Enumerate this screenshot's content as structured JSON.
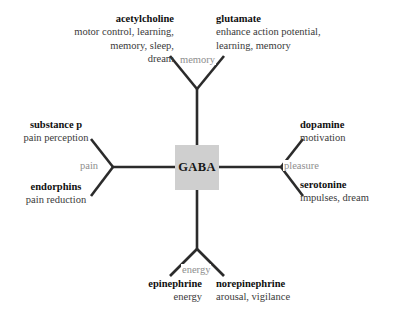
{
  "diagram": {
    "type": "radial-mind-map",
    "center": {
      "label": "GABA",
      "box_color": "#cfcfcf"
    },
    "colors": {
      "line": "#2b2b2b",
      "edge_label": "#8e8e8e",
      "title": "#101010",
      "description": "#3a3a3a",
      "background": "#ffffff"
    },
    "branches": [
      {
        "edge_label": "memory",
        "direction": "up",
        "leaves": [
          {
            "title": "acetylcholine",
            "description": "motor control, learning, memory, sleep, dream"
          },
          {
            "title": "glutamate",
            "description": "enhance action potential, learning, memory"
          }
        ]
      },
      {
        "edge_label": "pain",
        "direction": "left",
        "leaves": [
          {
            "title": "substance p",
            "description": "pain perception"
          },
          {
            "title": "endorphins",
            "description": "pain reduction"
          }
        ]
      },
      {
        "edge_label": "pleasure",
        "direction": "right",
        "leaves": [
          {
            "title": "dopamine",
            "description": "motivation"
          },
          {
            "title": "serotonine",
            "description": "impulses, dream"
          }
        ]
      },
      {
        "edge_label": "energy",
        "direction": "down",
        "leaves": [
          {
            "title": "epinephrine",
            "description": "energy"
          },
          {
            "title": "norepinephrine",
            "description": "arousal, vigilance"
          }
        ]
      }
    ]
  },
  "leaves": {
    "acetylcholine": {
      "title": "acetylcholine",
      "line1": "motor control, learning,",
      "line2": "memory, sleep,",
      "line3": "dream"
    },
    "glutamate": {
      "title": "glutamate",
      "line1": "enhance action potential,",
      "line2": "learning, memory"
    },
    "substance_p": {
      "title": "substance p",
      "line1": "pain perception"
    },
    "endorphins": {
      "title": "endorphins",
      "line1": "pain reduction"
    },
    "dopamine": {
      "title": "dopamine",
      "line1": "motivation"
    },
    "serotonine": {
      "title": "serotonine",
      "line1": "impulses, dream"
    },
    "epinephrine": {
      "title": "epinephrine",
      "line1": "energy"
    },
    "norepinephrine": {
      "title": "norepinephrine",
      "line1": "arousal, vigilance"
    }
  },
  "edge_labels": {
    "memory": "memory",
    "pain": "pain",
    "pleasure": "pleasure",
    "energy": "energy"
  }
}
